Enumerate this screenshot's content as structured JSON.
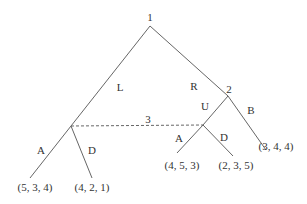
{
  "diagram": {
    "type": "extensive-form game tree",
    "colors": {
      "line": "#666666",
      "text": "#333333",
      "background": "#ffffff"
    },
    "nodes": [
      {
        "id": "n1",
        "label": "1"
      },
      {
        "id": "n2",
        "label": "2"
      },
      {
        "id": "n3a",
        "label": ""
      },
      {
        "id": "n3b",
        "label": ""
      }
    ],
    "info_set": {
      "label": "3",
      "style": "dashed"
    },
    "edges": [
      {
        "from": "n1",
        "to": "n3a",
        "label": "L"
      },
      {
        "from": "n1",
        "to": "n2",
        "label": "R"
      },
      {
        "from": "n2",
        "to": "n3b",
        "label": "U"
      },
      {
        "from": "n2",
        "to": "t5",
        "label": "B"
      },
      {
        "from": "n3a",
        "to": "t1",
        "label": "A"
      },
      {
        "from": "n3a",
        "to": "t2",
        "label": "D"
      },
      {
        "from": "n3b",
        "to": "t3",
        "label": "A"
      },
      {
        "from": "n3b",
        "to": "t4",
        "label": "D"
      }
    ],
    "payoffs": [
      {
        "id": "t1",
        "label": "(5, 3, 4)"
      },
      {
        "id": "t2",
        "label": "(4, 2, 1)"
      },
      {
        "id": "t3",
        "label": "(4, 5, 3)"
      },
      {
        "id": "t4",
        "label": "(2, 3, 5)"
      },
      {
        "id": "t5",
        "label": "(3, 4, 4)"
      }
    ]
  }
}
